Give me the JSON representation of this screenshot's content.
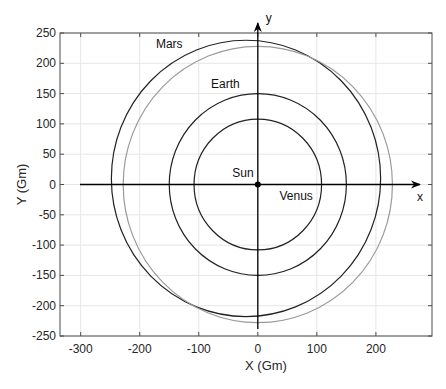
{
  "chart_data": {
    "type": "scatter",
    "title": "",
    "xlabel": "X (Gm)",
    "ylabel": "Y (Gm)",
    "xlim": [
      -335,
      295
    ],
    "ylim": [
      -250,
      250
    ],
    "xticks": [
      -300,
      -200,
      -100,
      0,
      100,
      200
    ],
    "yticks": [
      250,
      200,
      150,
      100,
      50,
      0,
      -50,
      -100,
      -150,
      -200,
      -250
    ],
    "grid": true,
    "legend": null,
    "axis_arrows": {
      "x_label": "x",
      "y_label": "y"
    },
    "series": [
      {
        "name": "Venus orbit",
        "shape": "circle",
        "center": [
          0,
          0
        ],
        "radius": 108,
        "color": "#222222",
        "style": "solid"
      },
      {
        "name": "Earth orbit",
        "shape": "circle",
        "center": [
          0,
          0
        ],
        "radius": 150,
        "color": "#222222",
        "style": "solid"
      },
      {
        "name": "Mars orbit (ellipse)",
        "shape": "ellipse",
        "center": [
          -20,
          10
        ],
        "rx": 228,
        "ry": 228,
        "color": "#222222",
        "style": "solid"
      },
      {
        "name": "Mars orbit (circular approx.)",
        "shape": "circle",
        "center": [
          0,
          0
        ],
        "radius": 228,
        "color": "#9a9a9a",
        "style": "solid"
      },
      {
        "name": "Sun",
        "shape": "point",
        "center": [
          0,
          0
        ],
        "color": "#000000"
      }
    ],
    "annotations": [
      {
        "text": "Mars",
        "x": -150,
        "y": 225
      },
      {
        "text": "Earth",
        "x": -55,
        "y": 160
      },
      {
        "text": "Sun",
        "x": -25,
        "y": 12
      },
      {
        "text": "Venus",
        "x": 65,
        "y": -25
      }
    ]
  }
}
